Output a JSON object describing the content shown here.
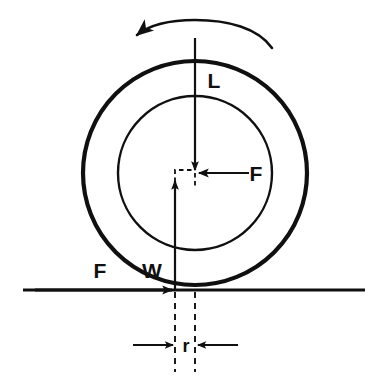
{
  "figure": {
    "type": "force-diagram",
    "background_color": "#ffffff",
    "ink_color": "#101010",
    "width": 380,
    "height": 383
  },
  "labels": {
    "load": "L",
    "force_center": "F",
    "force_ground": "F",
    "reaction": "W",
    "offset": "r"
  },
  "label_positions": {
    "load": {
      "x": 214,
      "y": 88
    },
    "force_center": {
      "x": 256,
      "y": 180
    },
    "force_ground": {
      "x": 100,
      "y": 277
    },
    "reaction": {
      "x": 152,
      "y": 277
    },
    "offset": {
      "x": 186,
      "y": 351
    }
  },
  "geometry": {
    "center": {
      "x": 195,
      "y": 173
    },
    "outer_circle_radius": 112,
    "inner_circle_radius": 77,
    "ground_line_y": 290,
    "ground_line_x_start": 23,
    "ground_line_x_end": 365,
    "contact_offset_x": 175,
    "dashed_axis_x": 195,
    "dashed_offset_x": 175,
    "dimension_line_y": 345
  },
  "elements": [
    {
      "name": "rotation-arrow",
      "description": "counter-clockwise arc above wheel",
      "direction": "counterclockwise"
    },
    {
      "name": "outer-circle",
      "description": "tire outer wall, thick stroke"
    },
    {
      "name": "inner-circle",
      "description": "wheel rim, thin stroke"
    },
    {
      "name": "load-arrow",
      "description": "vertical downward arrow labelled L"
    },
    {
      "name": "center-force-arrow",
      "description": "horizontal leftward arrow labelled F"
    },
    {
      "name": "reaction-arrow",
      "description": "vertical upward arrow labelled W"
    },
    {
      "name": "ground-force-arrow",
      "description": "horizontal rightward arrow on ground labelled F"
    },
    {
      "name": "ground-line",
      "description": "horizontal road surface"
    },
    {
      "name": "offset-dimension",
      "description": "dimension between contact point and axis labelled r"
    }
  ]
}
